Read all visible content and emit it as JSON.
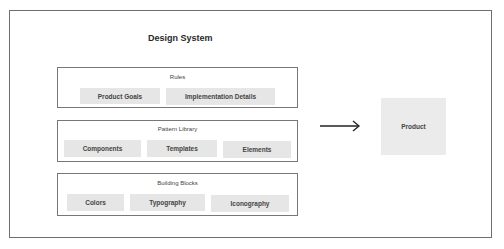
{
  "title": "Design System",
  "groups": {
    "rules": {
      "label": "Rules",
      "items": [
        "Product Goals",
        "Implementation Details"
      ]
    },
    "pattern_library": {
      "label": "Pattern Library",
      "items": [
        "Components",
        "Templates",
        "Elements"
      ]
    },
    "building_blocks": {
      "label": "Building Blocks",
      "items": [
        "Colors",
        "Typography",
        "Iconography"
      ]
    }
  },
  "arrow": {
    "direction": "right"
  },
  "output": {
    "label": "Product"
  }
}
